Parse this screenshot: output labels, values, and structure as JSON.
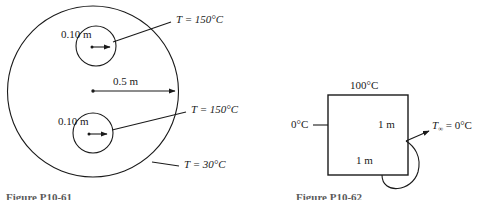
{
  "figure_left": {
    "name": "circular-domain-diagram",
    "outer_boundary_label": {
      "var": "T",
      "eq": "=",
      "value": "30°C",
      "full": "T = 30°C"
    },
    "hole_labels": [
      {
        "var": "T",
        "eq": "=",
        "value": "150°C",
        "full": "T = 150°C"
      },
      {
        "var": "T",
        "eq": "=",
        "value": "150°C",
        "full": "T = 150°C"
      }
    ],
    "hole_dimensions": [
      "0.10 m",
      "0.10 m"
    ],
    "radius_dimension": "0.5 m",
    "caption": "Figure P10-61"
  },
  "figure_right": {
    "name": "square-domain-diagram",
    "top_label": "100°C",
    "left_label": "0°C",
    "side_dimension": "1 m",
    "bottom_dimension": "1 m",
    "ambient_label": {
      "var": "T",
      "subscript": "∞",
      "eq": "=",
      "value": "0°C"
    },
    "caption": "Figure P10-62"
  },
  "style": {
    "ink": "#1a1a1a",
    "caption_color": "#5a5a5a",
    "background": "#ffffff"
  }
}
